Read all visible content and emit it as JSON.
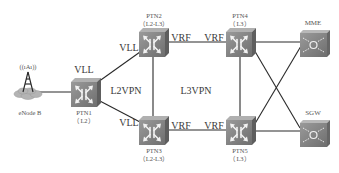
{
  "diagram": {
    "title": "",
    "nodes": [
      {
        "id": "enodeb",
        "label": "eNode B",
        "type": "base-station"
      },
      {
        "id": "ptn1",
        "label": "PTN1",
        "sublabel": "（L2）",
        "type": "router"
      },
      {
        "id": "ptn2",
        "label": "PTN2",
        "sublabel": "（L2-L3）",
        "type": "router"
      },
      {
        "id": "ptn3",
        "label": "PTN3",
        "sublabel": "（L2-L3）",
        "type": "router"
      },
      {
        "id": "ptn4",
        "label": "PTN4",
        "sublabel": "（L3）",
        "type": "router"
      },
      {
        "id": "ptn5",
        "label": "PTN5",
        "sublabel": "（L3）",
        "type": "router"
      },
      {
        "id": "mme",
        "label": "MME",
        "type": "core-node"
      },
      {
        "id": "sgw",
        "label": "SGW",
        "type": "core-node"
      }
    ],
    "edge_labels": {
      "vll_ptn1": "VLL",
      "vll_ptn2": "VLL",
      "vll_ptn3": "VLL",
      "vrf_ptn2": "VRF",
      "vrf_ptn4": "VRF",
      "vrf_ptn3": "VRF",
      "vrf_ptn5": "VRF"
    },
    "regions": {
      "l2vpn": "L2VPN",
      "l3vpn": "L3VPN"
    },
    "antenna_signal": "((ıAı))",
    "links": [
      [
        "enodeb",
        "ptn1"
      ],
      [
        "ptn1",
        "ptn2"
      ],
      [
        "ptn1",
        "ptn3"
      ],
      [
        "ptn2",
        "ptn3"
      ],
      [
        "ptn2",
        "ptn4"
      ],
      [
        "ptn3",
        "ptn5"
      ],
      [
        "ptn4",
        "ptn5"
      ],
      [
        "ptn4",
        "mme"
      ],
      [
        "ptn4",
        "sgw"
      ],
      [
        "ptn5",
        "mme"
      ],
      [
        "ptn5",
        "sgw"
      ]
    ],
    "colors": {
      "router_face": "#8a8a8a",
      "router_side": "#6a6a6a",
      "router_top": "#a8a8a8",
      "line": "#2a2a2a",
      "cloud": "#b0b0b0"
    }
  }
}
